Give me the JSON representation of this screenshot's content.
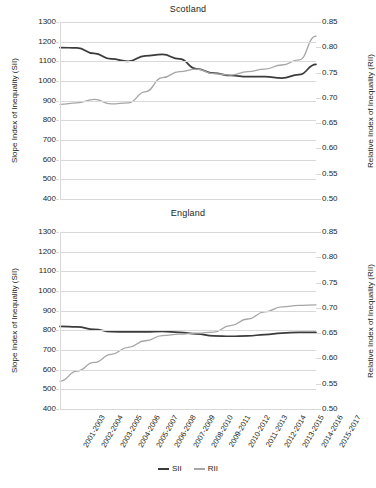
{
  "figure": {
    "left_axis_title": "Slope Index of Inequality (SII)",
    "right_axis_title": "Relative Index of Inequality (RII)"
  },
  "legend": {
    "position": "bottom-center",
    "items": [
      {
        "label": "SII",
        "color": "#3b3b3b"
      },
      {
        "label": "RII",
        "color": "#a6a6a6"
      }
    ]
  },
  "colors": {
    "sii": "#3b3b3b",
    "rii": "#a6a6a6",
    "grid": "#d9d9d9",
    "text": "#231f20"
  },
  "x_categories": [
    "2001-2003",
    "2002-2004",
    "2003-2005",
    "2004-2006",
    "2005-2007",
    "2006-2008",
    "2007-2009",
    "2008-2010",
    "2009-2011",
    "2010-2012",
    "2011-2013",
    "2012-2014",
    "2013-2015",
    "2014-2016",
    "2015-2017"
  ],
  "y_left_ticks": [
    "1300",
    "1200",
    "1100",
    "1000",
    "900",
    "800",
    "700",
    "600",
    "500",
    "400"
  ],
  "y_right_ticks": [
    "0.85",
    "0.80",
    "0.75",
    "0.70",
    "0.65",
    "0.60",
    "0.55",
    "0.50"
  ],
  "panels": [
    {
      "title": "Scotland"
    },
    {
      "title": "England"
    }
  ],
  "chart_data": [
    {
      "type": "line",
      "title": "Scotland",
      "xlabel": "",
      "ylabel": "Slope Index of Inequality (SII)",
      "y2label": "Relative Index of Inequality (RII)",
      "ylim": [
        400,
        1300
      ],
      "y2lim": [
        0.5,
        0.85
      ],
      "grid": true,
      "legend_position": "bottom-center",
      "categories": [
        "2001-2003",
        "2002-2004",
        "2003-2005",
        "2004-2006",
        "2005-2007",
        "2006-2008",
        "2007-2009",
        "2008-2010",
        "2009-2011",
        "2010-2012",
        "2011-2013",
        "2012-2014",
        "2013-2015",
        "2014-2016",
        "2015-2017"
      ],
      "series": [
        {
          "name": "SII",
          "axis": "left",
          "color": "#3b3b3b",
          "values": [
            1170,
            1168,
            1140,
            1112,
            1100,
            1128,
            1135,
            1112,
            1062,
            1040,
            1028,
            1022,
            1022,
            1015,
            1032,
            1085
          ]
        },
        {
          "name": "RII",
          "axis": "right",
          "color": "#a6a6a6",
          "values": [
            0.687,
            0.69,
            0.697,
            0.688,
            0.69,
            0.712,
            0.74,
            0.752,
            0.757,
            0.748,
            0.745,
            0.752,
            0.757,
            0.765,
            0.775,
            0.822
          ]
        }
      ]
    },
    {
      "type": "line",
      "title": "England",
      "xlabel": "",
      "ylabel": "Slope Index of Inequality (SII)",
      "y2label": "Relative Index of Inequality (RII)",
      "ylim": [
        400,
        1300
      ],
      "y2lim": [
        0.5,
        0.85
      ],
      "grid": true,
      "legend_position": "bottom-center",
      "categories": [
        "2001-2003",
        "2002-2004",
        "2003-2005",
        "2004-2006",
        "2005-2007",
        "2006-2008",
        "2007-2009",
        "2008-2010",
        "2009-2011",
        "2010-2012",
        "2011-2013",
        "2012-2014",
        "2013-2015",
        "2014-2016",
        "2015-2017"
      ],
      "series": [
        {
          "name": "SII",
          "axis": "left",
          "color": "#3b3b3b",
          "values": [
            820,
            818,
            805,
            793,
            792,
            792,
            795,
            790,
            782,
            772,
            770,
            772,
            778,
            786,
            790,
            790
          ]
        },
        {
          "name": "RII",
          "axis": "right",
          "color": "#a6a6a6",
          "values": [
            0.555,
            0.575,
            0.592,
            0.608,
            0.622,
            0.635,
            0.645,
            0.648,
            0.65,
            0.652,
            0.665,
            0.678,
            0.692,
            0.702,
            0.705,
            0.706
          ]
        }
      ]
    }
  ]
}
